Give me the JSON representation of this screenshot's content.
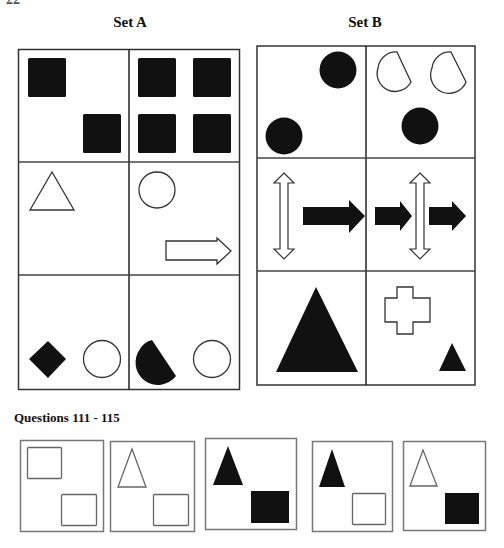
{
  "page": {
    "number_fragment": "22"
  },
  "set_a": {
    "title": "Set A",
    "cells": [
      {
        "row": 1,
        "col": 1,
        "shapes": [
          "black-square",
          "black-square"
        ]
      },
      {
        "row": 1,
        "col": 2,
        "shapes": [
          "black-square",
          "black-square",
          "black-square",
          "black-square"
        ]
      },
      {
        "row": 2,
        "col": 1,
        "shapes": [
          "white-triangle"
        ]
      },
      {
        "row": 2,
        "col": 2,
        "shapes": [
          "white-circle",
          "white-arrow-right"
        ]
      },
      {
        "row": 3,
        "col": 1,
        "shapes": [
          "black-diamond",
          "white-circle"
        ]
      },
      {
        "row": 3,
        "col": 2,
        "shapes": [
          "black-half-circle",
          "white-circle"
        ]
      }
    ]
  },
  "set_b": {
    "title": "Set B",
    "cells": [
      {
        "row": 1,
        "col": 1,
        "shapes": [
          "black-circle",
          "black-circle"
        ]
      },
      {
        "row": 1,
        "col": 2,
        "shapes": [
          "white-half-circle",
          "white-half-circle",
          "black-circle"
        ]
      },
      {
        "row": 2,
        "col": 1,
        "shapes": [
          "white-double-arrow-vertical",
          "black-arrow-right"
        ]
      },
      {
        "row": 2,
        "col": 2,
        "shapes": [
          "black-arrow-right",
          "white-double-arrow-vertical",
          "black-arrow-right"
        ]
      },
      {
        "row": 3,
        "col": 1,
        "shapes": [
          "large-black-triangle"
        ]
      },
      {
        "row": 3,
        "col": 2,
        "shapes": [
          "white-cross",
          "small-black-triangle"
        ]
      }
    ]
  },
  "questions": {
    "title": "Questions 111 - 115",
    "items": [
      {
        "number": 111,
        "shapes": [
          "white-rectangle",
          "white-rectangle"
        ]
      },
      {
        "number": 112,
        "shapes": [
          "white-triangle",
          "white-rectangle"
        ]
      },
      {
        "number": 113,
        "shapes": [
          "black-triangle",
          "black-rectangle"
        ]
      },
      {
        "number": 114,
        "shapes": [
          "black-triangle",
          "white-rectangle"
        ]
      },
      {
        "number": 115,
        "shapes": [
          "white-triangle",
          "black-rectangle"
        ]
      }
    ]
  },
  "colors": {
    "ink": "#111111",
    "grid_line": "#333333",
    "question_border": "#777777",
    "background": "#ffffff"
  }
}
